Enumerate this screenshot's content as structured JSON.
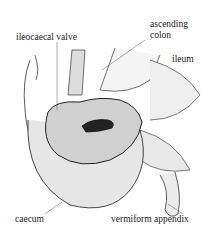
{
  "diagram": {
    "labels": {
      "ileocaecal_valve": "ileocaecal valve",
      "ascending_colon_1": "ascending",
      "ascending_colon_2": "colon",
      "ileum": "ileum",
      "caecum": "caecum",
      "vermiform_appendix": "vermiform appendix"
    }
  }
}
